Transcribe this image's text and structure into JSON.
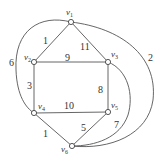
{
  "graph": {
    "nodes": [
      {
        "id": "v1",
        "name": "v",
        "sub": "1",
        "x": 71,
        "y": 22,
        "lx": 66,
        "ly": 15
      },
      {
        "id": "v2",
        "name": "v",
        "sub": "2",
        "x": 34,
        "y": 62,
        "lx": 24,
        "ly": 60
      },
      {
        "id": "v3",
        "name": "v",
        "sub": "3",
        "x": 108,
        "y": 62,
        "lx": 111,
        "ly": 57
      },
      {
        "id": "v4",
        "name": "v",
        "sub": "4",
        "x": 34,
        "y": 113,
        "lx": 38,
        "ly": 109
      },
      {
        "id": "v5",
        "name": "v",
        "sub": "5",
        "x": 108,
        "y": 112,
        "lx": 111,
        "ly": 108
      },
      {
        "id": "v6",
        "name": "v",
        "sub": "6",
        "x": 72,
        "y": 146,
        "lx": 61,
        "ly": 152
      }
    ],
    "edges": [
      {
        "from": "v1",
        "to": "v2",
        "weight": "1",
        "lx": 43,
        "ly": 44
      },
      {
        "from": "v1",
        "to": "v3",
        "weight": "11",
        "lx": 80,
        "ly": 50
      },
      {
        "from": "v2",
        "to": "v3",
        "weight": "9",
        "lx": 65,
        "ly": 61
      },
      {
        "from": "v2",
        "to": "v4",
        "weight": "3",
        "lx": 27,
        "ly": 89
      },
      {
        "from": "v3",
        "to": "v5",
        "weight": "8",
        "lx": 98,
        "ly": 93
      },
      {
        "from": "v4",
        "to": "v5",
        "weight": "10",
        "lx": 64,
        "ly": 109
      },
      {
        "from": "v4",
        "to": "v6",
        "weight": "1",
        "lx": 43,
        "ly": 137
      },
      {
        "from": "v5",
        "to": "v6",
        "weight": "5",
        "lx": 81,
        "ly": 131
      },
      {
        "from": "v1",
        "to": "v4",
        "weight": "6",
        "lx": 9,
        "ly": 66,
        "curve": "M71,22 C40,14 14,30 16,70 C17,96 26,108 34,113"
      },
      {
        "from": "v1",
        "to": "v6",
        "weight": "2",
        "lx": 148,
        "ly": 61,
        "curve": "M71,22 C120,28 158,55 153,100 C148,135 110,150 72,146"
      },
      {
        "from": "v3",
        "to": "v6",
        "weight": "7",
        "lx": 114,
        "ly": 128,
        "curve": "M108,62 C128,70 134,95 128,115 C120,138 95,146 72,146"
      }
    ]
  }
}
